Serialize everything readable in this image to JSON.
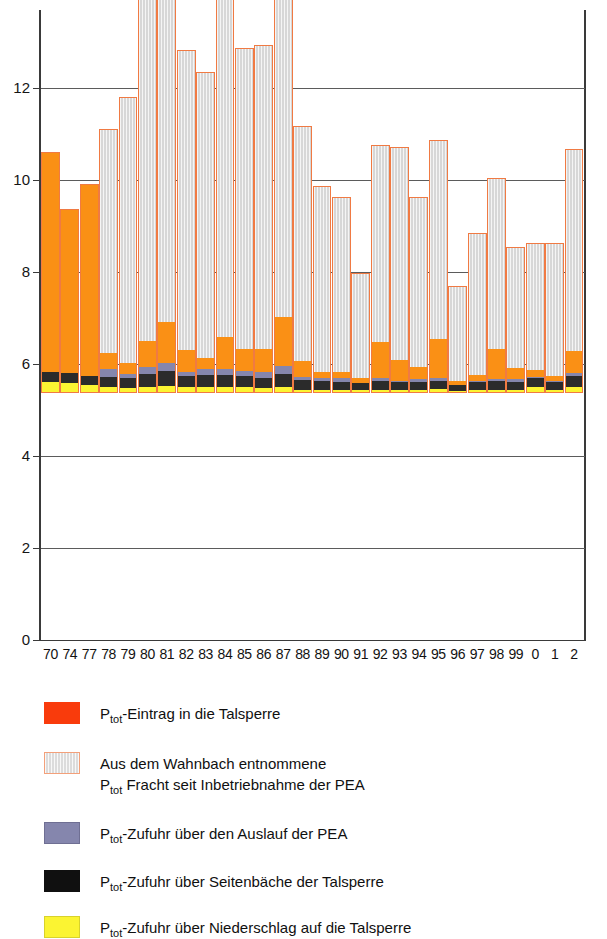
{
  "chart_data": {
    "type": "bar",
    "stacked": true,
    "title": "",
    "xlabel": "",
    "ylabel": "",
    "ylim": [
      0,
      13.7
    ],
    "yticks": [
      0,
      2,
      4,
      6,
      8,
      10,
      12
    ],
    "grid": true,
    "legend_position": "below",
    "categories": [
      "70",
      "74",
      "77",
      "78",
      "79",
      "80",
      "81",
      "82",
      "83",
      "84",
      "85",
      "86",
      "87",
      "88",
      "89",
      "90",
      "91",
      "92",
      "93",
      "94",
      "95",
      "96",
      "97",
      "98",
      "99",
      "0",
      "1",
      "2"
    ],
    "series": [
      {
        "name": "P_tot-Zufuhr über Niederschlag auf die Talsperre",
        "color": "#fbf432",
        "values": [
          0.22,
          0.2,
          0.16,
          0.1,
          0.09,
          0.1,
          0.13,
          0.1,
          0.1,
          0.11,
          0.1,
          0.09,
          0.1,
          0.04,
          0.04,
          0.04,
          0.04,
          0.05,
          0.04,
          0.05,
          0.06,
          0.02,
          0.05,
          0.04,
          0.05,
          0.1,
          0.05,
          0.1
        ]
      },
      {
        "name": "P_tot-Zufuhr über Seitenbäche der Talsperre",
        "color": "#2b2b2b",
        "values": [
          0.22,
          0.22,
          0.2,
          0.23,
          0.22,
          0.3,
          0.33,
          0.24,
          0.27,
          0.26,
          0.24,
          0.22,
          0.29,
          0.22,
          0.2,
          0.19,
          0.15,
          0.2,
          0.17,
          0.18,
          0.19,
          0.14,
          0.17,
          0.2,
          0.18,
          0.2,
          0.17,
          0.25
        ]
      },
      {
        "name": "P_tot-Zufuhr über den Auslauf der PEA",
        "color": "#8586ad",
        "values": [
          0.0,
          0.0,
          0.0,
          0.18,
          0.09,
          0.14,
          0.18,
          0.09,
          0.13,
          0.14,
          0.11,
          0.13,
          0.17,
          0.07,
          0.06,
          0.07,
          0.02,
          0.05,
          0.04,
          0.06,
          0.06,
          0.0,
          0.03,
          0.04,
          0.05,
          0.04,
          0.03,
          0.06
        ]
      },
      {
        "name": "P_tot-Eintrag in die Talsperre (orange Anteil)",
        "color": "#fa9015",
        "values": [
          4.8,
          3.58,
          4.19,
          0.34,
          0.24,
          0.57,
          0.88,
          0.49,
          0.25,
          0.7,
          0.49,
          0.5,
          1.08,
          0.36,
          0.13,
          0.13,
          0.11,
          0.79,
          0.46,
          0.27,
          0.85,
          0.09,
          0.12,
          0.67,
          0.25,
          0.15,
          0.1,
          0.49
        ]
      },
      {
        "name": "Aus dem Wahnbach entnommene P_tot Fracht seit Inbetriebnahme der PEA",
        "color": "#d7d7d7",
        "values": [
          0.0,
          0.0,
          0.0,
          4.9,
          5.8,
          9.49,
          11.0,
          6.53,
          6.22,
          10.49,
          6.57,
          6.62,
          9.03,
          5.11,
          4.07,
          3.84,
          2.28,
          4.3,
          4.63,
          3.7,
          4.33,
          2.08,
          3.1,
          3.73,
          2.65,
          2.78,
          2.91,
          4.4
        ]
      }
    ],
    "totals": [
      5.25,
      4.0,
      4.55,
      5.75,
      6.45,
      10.6,
      12.52,
      7.45,
      7.05,
      11.7,
      7.5,
      7.55,
      10.67,
      5.8,
      4.5,
      4.27,
      2.6,
      5.39,
      5.34,
      4.26,
      5.49,
      2.33,
      3.47,
      4.68,
      3.18,
      3.27,
      3.26,
      5.3
    ]
  },
  "axes": {
    "y_tick_labels": [
      "12",
      "10",
      "8",
      "6",
      "4",
      "2",
      "0"
    ],
    "x_tick_labels": [
      "70",
      "74",
      "77",
      "78",
      "79",
      "80",
      "81",
      "82",
      "83",
      "84",
      "85",
      "86",
      "87",
      "88",
      "89",
      "90",
      "91",
      "92",
      "93",
      "94",
      "95",
      "96",
      "97",
      "98",
      "99",
      "0",
      "1",
      "2"
    ]
  },
  "legend": {
    "items": [
      {
        "swatch": "sw-red",
        "swatch_name": "legend-swatch-eintrag",
        "prefix": "P",
        "subscript": "tot",
        "rest": "-Eintrag in die Talsperre",
        "line2": ""
      },
      {
        "swatch": "sw-gray",
        "swatch_name": "legend-swatch-wahnbach",
        "prefix": "",
        "subscript": "",
        "rest": "Aus dem Wahnbach entnommene",
        "line2": "P tot  Fracht seit Inbetriebnahme der PEA"
      },
      {
        "swatch": "sw-purple",
        "swatch_name": "legend-swatch-auslauf",
        "prefix": "P",
        "subscript": "tot",
        "rest": "-Zufuhr über den Auslauf der PEA",
        "line2": ""
      },
      {
        "swatch": "sw-black",
        "swatch_name": "legend-swatch-seitenbaeche",
        "prefix": "P",
        "subscript": "tot",
        "rest": "-Zufuhr über Seitenbäche der Talsperre",
        "line2": ""
      },
      {
        "swatch": "sw-yellow",
        "swatch_name": "legend-swatch-niederschlag",
        "prefix": "P",
        "subscript": "tot",
        "rest": "-Zufuhr über Niederschlag auf die Talsperre",
        "line2": ""
      }
    ],
    "wahnbach_line2_prefix": "P",
    "wahnbach_line2_sub": "tot",
    "wahnbach_line2_rest": "  Fracht seit Inbetriebnahme der PEA"
  },
  "colors": {
    "eintrag_red": "#f93b0c",
    "wahnbach_gray": "#d7d7d7",
    "auslauf_purple": "#8586ad",
    "seitenbaeche_black": "#2b2b2b",
    "niederschlag_yellow": "#fbf432",
    "bar_outline": "#f07a43",
    "bar_orange": "#fa9015",
    "axis": "#3a3a3a"
  }
}
